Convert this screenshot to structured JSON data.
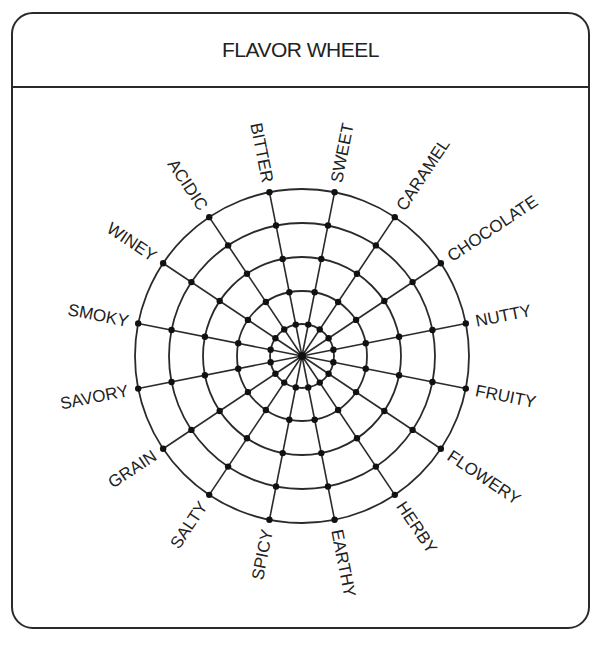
{
  "header": {
    "title": "FLAVOR WHEEL"
  },
  "wheel": {
    "center": [
      302,
      356
    ],
    "ring_radii": [
      32,
      65,
      99,
      133,
      167
    ],
    "start_angle_deg": -78.75,
    "step_deg": 22.5,
    "label_offset": 10,
    "stroke": "#2a2a2a",
    "labels": [
      "SWEET",
      "CARAMEL",
      "CHOCOLATE",
      "NUTTY",
      "FRUITY",
      "FLOWERY",
      "HERBY",
      "EARTHY",
      "SPICY",
      "SALTY",
      "GRAIN",
      "SAVORY",
      "SMOKY",
      "WINEY",
      "ACIDIC",
      "BITTER"
    ]
  }
}
